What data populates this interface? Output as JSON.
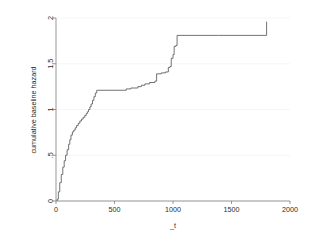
{
  "chart_data": {
    "type": "line",
    "subtype": "step-post",
    "title": "",
    "xlabel": "_t",
    "ylabel": "cumulative baseline hazard",
    "xlim": [
      0,
      2000
    ],
    "ylim": [
      0,
      2
    ],
    "xticks": [
      0,
      500,
      1000,
      1500,
      2000
    ],
    "xtick_labels": [
      "0",
      "500",
      "1000",
      "1500",
      "2000"
    ],
    "yticks": [
      0,
      0.5,
      1,
      1.5,
      2
    ],
    "ytick_labels": [
      "0",
      ".5",
      "1",
      "1.5",
      "2"
    ],
    "grid": true,
    "grid_axis": "y",
    "legend": false,
    "legend_position": "none",
    "line_color": "#5a5a5a",
    "series": [
      {
        "name": "cumulative baseline hazard",
        "x": [
          10,
          20,
          32,
          45,
          58,
          70,
          82,
          95,
          108,
          118,
          128,
          140,
          152,
          164,
          176,
          190,
          204,
          218,
          232,
          246,
          258,
          268,
          278,
          290,
          300,
          312,
          324,
          336,
          348,
          352,
          575,
          600,
          640,
          700,
          730,
          760,
          800,
          845,
          860,
          900,
          935,
          960,
          975,
          985,
          1000,
          1010,
          1025,
          1035,
          1390,
          1800
        ],
        "y": [
          0.02,
          0.1,
          0.2,
          0.29,
          0.37,
          0.44,
          0.5,
          0.56,
          0.62,
          0.67,
          0.72,
          0.755,
          0.775,
          0.8,
          0.825,
          0.85,
          0.875,
          0.895,
          0.915,
          0.935,
          0.955,
          0.975,
          1.0,
          1.03,
          1.06,
          1.1,
          1.14,
          1.18,
          1.21,
          1.21,
          1.21,
          1.225,
          1.235,
          1.25,
          1.265,
          1.28,
          1.295,
          1.31,
          1.39,
          1.4,
          1.41,
          1.46,
          1.47,
          1.56,
          1.6,
          1.69,
          1.7,
          1.81,
          1.81,
          1.96
        ]
      }
    ]
  },
  "axes": {
    "x_axis_name": "x-axis",
    "y_axis_name": "y-axis"
  }
}
